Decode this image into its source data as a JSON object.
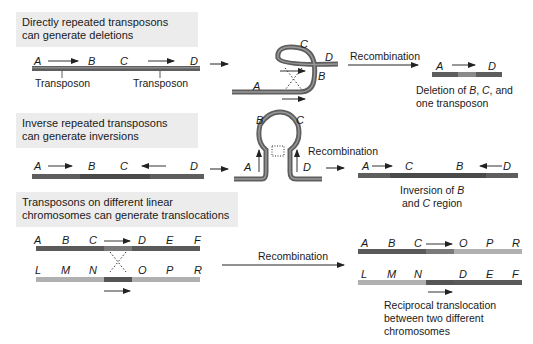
{
  "panels": [
    {
      "title_line1": "Directly repeated transposons",
      "title_line2": "can generate deletions",
      "initial_labels": [
        "A",
        "B",
        "C",
        "D"
      ],
      "transposon_label": "Transposon",
      "loop_labels": [
        "A",
        "B",
        "C",
        "D"
      ],
      "arrow_label": "Recombination",
      "result_labels": [
        "A",
        "D"
      ],
      "caption_line1_prefix": "Deletion of ",
      "caption_B": "B",
      "caption_sep": ", ",
      "caption_C": "C",
      "caption_line1_suffix": ", and",
      "caption_line2": "one transposon"
    },
    {
      "title_line1": "Inverse repeated transposons",
      "title_line2": "can generate inversions",
      "initial_labels": [
        "A",
        "B",
        "C",
        "D"
      ],
      "loop_labels": [
        "A",
        "B",
        "C",
        "D"
      ],
      "arrow_label": "Recombination",
      "result_labels": [
        "A",
        "C",
        "B",
        "D"
      ],
      "caption_line1_prefix": "Inversion of ",
      "caption_B": "B",
      "caption_line2_prefix": "and ",
      "caption_C": "C",
      "caption_line2_suffix": " region"
    },
    {
      "title_line1": "Transposons on different linear",
      "title_line2": "chromosomes can generate translocations",
      "top_labels": [
        "A",
        "B",
        "C",
        "D",
        "E",
        "F"
      ],
      "bottom_labels": [
        "L",
        "M",
        "N",
        "O",
        "P",
        "R"
      ],
      "arrow_label": "Recombination",
      "result_top_labels": [
        "A",
        "B",
        "C",
        "O",
        "P",
        "R"
      ],
      "result_bottom_labels": [
        "L",
        "M",
        "N",
        "D",
        "E",
        "F"
      ],
      "caption_line1": "Reciprocal translocation",
      "caption_line2": "between two different",
      "caption_line3": "chromosomes"
    }
  ],
  "colors": {
    "header_bg": "#ececec",
    "dark_chromosome": "#5a5a5a",
    "light_chromosome": "#a8a8a8",
    "transposon_segment": "#8a8a8a",
    "text": "#1a1a1a"
  }
}
